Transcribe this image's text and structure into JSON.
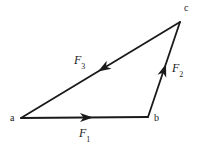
{
  "figure": {
    "name": "force-triangle-diagram",
    "background_color": "#ffffff",
    "stroke_color": "#1a1a1a",
    "text_color": "#1a1a1a",
    "width": 205,
    "height": 142
  },
  "vertices": [
    {
      "id": "a",
      "label": "a",
      "x": 21,
      "y": 118,
      "label_x": 10,
      "label_y": 113
    },
    {
      "id": "b",
      "label": "b",
      "x": 148,
      "y": 117,
      "label_x": 154,
      "label_y": 113
    },
    {
      "id": "c",
      "label": "c",
      "x": 180,
      "y": 22,
      "label_x": 184,
      "label_y": 3
    }
  ],
  "vectors": [
    {
      "id": "F1",
      "label": "F",
      "subscript": "1",
      "from": "a",
      "to": "b",
      "x1": 21,
      "y1": 118,
      "x2": 148,
      "y2": 117,
      "arrow_x": 93,
      "arrow_y": 117.4,
      "arrow_angle": 359.5,
      "label_x": 79,
      "label_y": 127
    },
    {
      "id": "F2",
      "label": "F",
      "subscript": "2",
      "from": "b",
      "to": "c",
      "x1": 148,
      "y1": 117,
      "x2": 180,
      "y2": 22,
      "arrow_x": 166,
      "arrow_y": 64,
      "arrow_angle": -71.4,
      "label_x": 172,
      "label_y": 62
    },
    {
      "id": "F3",
      "label": "F",
      "subscript": "3",
      "from": "c",
      "to": "a",
      "x1": 180,
      "y1": 22,
      "x2": 21,
      "y2": 118,
      "arrow_x": 98,
      "arrow_y": 71.5,
      "arrow_angle": 148.9,
      "label_x": 74,
      "label_y": 54
    }
  ],
  "chart_data": {
    "type": "diagram",
    "title": "",
    "nodes": [
      "a",
      "b",
      "c"
    ],
    "edges": [
      {
        "name": "F1",
        "from": "a",
        "to": "b"
      },
      {
        "name": "F2",
        "from": "b",
        "to": "c"
      },
      {
        "name": "F3",
        "from": "c",
        "to": "a"
      }
    ]
  }
}
